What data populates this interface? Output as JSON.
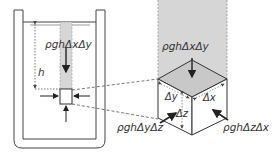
{
  "diagram": {
    "labels": {
      "top_force_left": "ρghΔxΔy",
      "depth": "h",
      "top_force_right": "ρghΔxΔy",
      "side_force_left": "ρghΔyΔz",
      "side_force_right": "ρghΔzΔx",
      "dim_x": "Δx",
      "dim_y": "Δy",
      "dim_z": "Δz"
    },
    "colors": {
      "column_fill": "#d6d6d6",
      "stroke": "#333333",
      "background": "#ffffff"
    }
  }
}
